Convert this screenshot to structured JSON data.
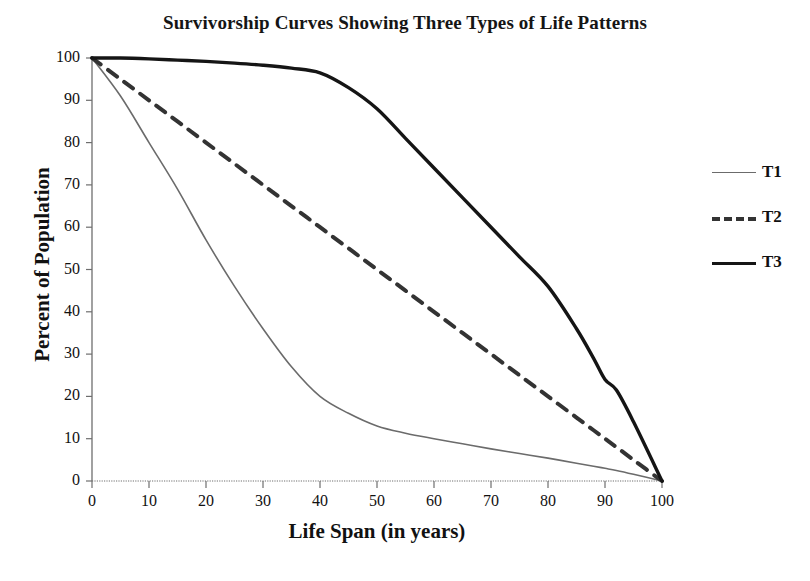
{
  "chart_data": {
    "type": "line",
    "title": "Survivorship Curves Showing Three Types of Life Patterns",
    "xlabel": "Life Span (in years)",
    "ylabel": "Percent of Population",
    "xlim": [
      0,
      100
    ],
    "ylim": [
      0,
      100
    ],
    "xticks": [
      0,
      10,
      20,
      30,
      40,
      50,
      60,
      70,
      80,
      90,
      100
    ],
    "yticks": [
      0,
      10,
      20,
      30,
      40,
      50,
      60,
      70,
      80,
      90,
      100
    ],
    "xtick_labels": [
      "0",
      "10",
      "20",
      "30",
      "40",
      "50",
      "60",
      "70",
      "80",
      "90",
      "100"
    ],
    "ytick_labels": [
      "0",
      "10",
      "20",
      "30",
      "40",
      "50",
      "60",
      "70",
      "80",
      "90",
      "100"
    ],
    "grid": false,
    "legend_position": "right",
    "x": [
      0,
      5,
      10,
      15,
      20,
      25,
      30,
      35,
      40,
      45,
      50,
      55,
      60,
      65,
      70,
      75,
      80,
      85,
      88,
      90,
      92,
      95,
      100
    ],
    "series": [
      {
        "name": "T1",
        "style": "solid-thin-gray",
        "color": "#6b6b6b",
        "width": 1.6,
        "values": [
          100,
          91,
          80,
          69,
          57,
          46,
          36,
          27,
          20,
          16,
          13,
          11.3,
          10,
          8.8,
          7.6,
          6.5,
          5.4,
          4.2,
          3.5,
          3.0,
          2.5,
          1.6,
          0
        ]
      },
      {
        "name": "T2",
        "style": "dashed",
        "color": "#333333",
        "width": 4,
        "values": [
          100,
          95,
          90,
          85,
          80,
          75,
          70,
          65,
          60,
          55,
          50,
          45,
          40,
          35,
          30,
          25,
          20,
          15,
          12,
          10,
          8,
          5,
          0
        ]
      },
      {
        "name": "T3",
        "style": "solid-thick-black",
        "color": "#151515",
        "width": 3.4,
        "values": [
          100,
          100,
          99.8,
          99.5,
          99.2,
          98.8,
          98.3,
          97.6,
          96.5,
          93,
          88,
          81,
          74,
          67,
          60,
          53,
          46,
          36,
          29,
          24,
          21.5,
          14,
          0
        ]
      }
    ],
    "legend": [
      {
        "name": "T1",
        "style": "solid-thin-gray"
      },
      {
        "name": "T2",
        "style": "dashed"
      },
      {
        "name": "T3",
        "style": "solid-thick-black"
      }
    ]
  },
  "colors": {
    "axis": "#6e6e6e",
    "text": "#111111",
    "t1": "#6b6b6b",
    "t2": "#333333",
    "t3": "#151515",
    "background": "#ffffff"
  }
}
